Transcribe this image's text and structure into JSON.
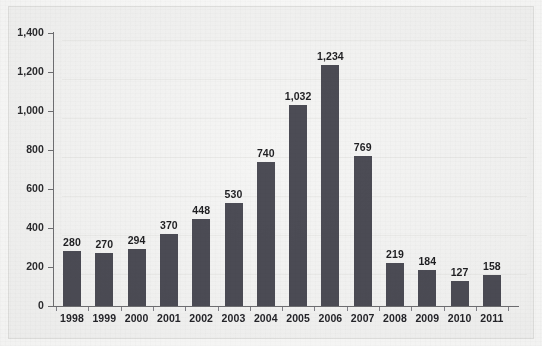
{
  "chart_data": {
    "type": "bar",
    "title": "",
    "subtitle": "",
    "xlabel": "",
    "ylabel": "",
    "categories": [
      "1998",
      "1999",
      "2000",
      "2001",
      "2002",
      "2003",
      "2004",
      "2005",
      "2006",
      "2007",
      "2008",
      "2009",
      "2010",
      "2011"
    ],
    "values": [
      280,
      270,
      294,
      370,
      448,
      530,
      740,
      1032,
      1234,
      769,
      219,
      184,
      127,
      158
    ],
    "value_labels": [
      "280",
      "270",
      "294",
      "370",
      "448",
      "530",
      "740",
      "1,032",
      "1,234",
      "769",
      "219",
      "184",
      "127",
      "158"
    ],
    "ylim": [
      0,
      1400
    ],
    "y_ticks": [
      0,
      200,
      400,
      600,
      800,
      1000,
      1200,
      1400
    ],
    "y_tick_labels": [
      "0",
      "200",
      "400",
      "600",
      "800",
      "1,000",
      "1,200",
      "1,400"
    ],
    "grid": true,
    "legend": "none",
    "series": [
      {
        "name": "",
        "values": [
          280,
          270,
          294,
          370,
          448,
          530,
          740,
          1032,
          1234,
          769,
          219,
          184,
          127,
          158
        ]
      }
    ],
    "colors": {
      "bar": "#4c4c55",
      "axis": "#6f6f72",
      "grid": "#ececea",
      "plot_background": "#f5f5f4",
      "figure_background": "#f4f4f3",
      "frame_border": "#e2e2e0",
      "label_text": "#1f1f22"
    }
  }
}
